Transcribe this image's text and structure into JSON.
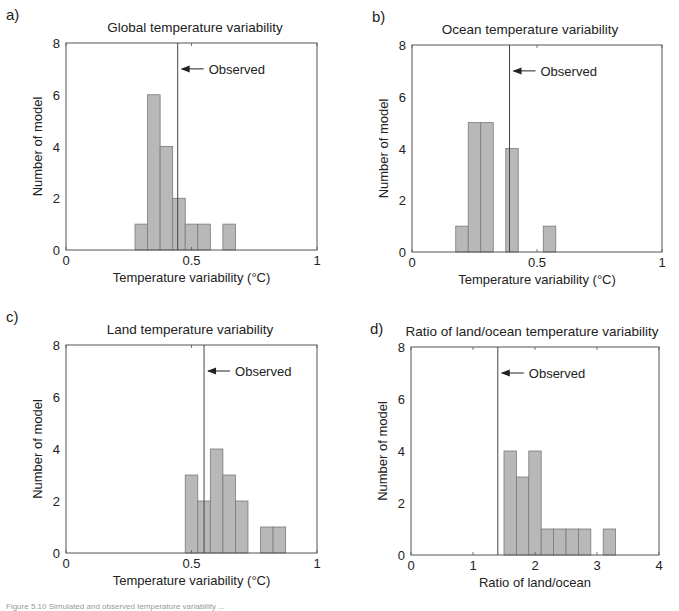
{
  "chart_data": [
    {
      "type": "bar",
      "panel_label": "a)",
      "title": "Global temperature variability",
      "xlabel": "Temperature variability (°C)",
      "ylabel": "Number of model",
      "xlim": [
        0,
        1
      ],
      "ylim": [
        0,
        8
      ],
      "xticks": [
        0,
        0.5,
        1
      ],
      "xtick_labels": [
        "0",
        "0.5",
        "1"
      ],
      "yticks": [
        0,
        2,
        4,
        6,
        8
      ],
      "ytick_labels": [
        "0",
        "2",
        "4",
        "6",
        "8"
      ],
      "bin_width": 0.05,
      "bins": [
        {
          "center": 0.3,
          "count": 1
        },
        {
          "center": 0.35,
          "count": 6
        },
        {
          "center": 0.4,
          "count": 4
        },
        {
          "center": 0.45,
          "count": 2
        },
        {
          "center": 0.5,
          "count": 1
        },
        {
          "center": 0.55,
          "count": 1
        },
        {
          "center": 0.65,
          "count": 1
        }
      ],
      "observed": {
        "value": 0.445,
        "label": "Observed",
        "arrow_y": 7
      }
    },
    {
      "type": "bar",
      "panel_label": "b)",
      "title": "Ocean temperature variability",
      "xlabel": "Temperature variability (°C)",
      "ylabel": "Number of model",
      "xlim": [
        0,
        1
      ],
      "ylim": [
        0,
        8
      ],
      "xticks": [
        0,
        0.5,
        1
      ],
      "xtick_labels": [
        "0",
        "0.5",
        "1"
      ],
      "yticks": [
        0,
        2,
        4,
        6,
        8
      ],
      "ytick_labels": [
        "0",
        "2",
        "4",
        "6",
        "8"
      ],
      "bin_width": 0.05,
      "bins": [
        {
          "center": 0.2,
          "count": 1
        },
        {
          "center": 0.25,
          "count": 5
        },
        {
          "center": 0.3,
          "count": 5
        },
        {
          "center": 0.4,
          "count": 4
        },
        {
          "center": 0.55,
          "count": 1
        }
      ],
      "observed": {
        "value": 0.39,
        "label": "Observed",
        "arrow_y": 7
      }
    },
    {
      "type": "bar",
      "panel_label": "c)",
      "title": "Land temperature variability",
      "xlabel": "Temperature variability (°C)",
      "ylabel": "Number of model",
      "xlim": [
        0,
        1
      ],
      "ylim": [
        0,
        8
      ],
      "xticks": [
        0,
        0.5,
        1
      ],
      "xtick_labels": [
        "0",
        "0.5",
        "1"
      ],
      "yticks": [
        0,
        2,
        4,
        6,
        8
      ],
      "ytick_labels": [
        "0",
        "2",
        "4",
        "6",
        "8"
      ],
      "bin_width": 0.05,
      "bins": [
        {
          "center": 0.5,
          "count": 3
        },
        {
          "center": 0.55,
          "count": 2
        },
        {
          "center": 0.6,
          "count": 4
        },
        {
          "center": 0.65,
          "count": 3
        },
        {
          "center": 0.7,
          "count": 2
        },
        {
          "center": 0.8,
          "count": 1
        },
        {
          "center": 0.85,
          "count": 1
        }
      ],
      "observed": {
        "value": 0.55,
        "label": "Observed",
        "arrow_y": 7
      }
    },
    {
      "type": "bar",
      "panel_label": "d)",
      "title": "Ratio of land/ocean temperature variability",
      "xlabel": "Ratio of land/ocean",
      "ylabel": "Number of model",
      "xlim": [
        0,
        4
      ],
      "ylim": [
        0,
        8
      ],
      "xticks": [
        0,
        1,
        2,
        3,
        4
      ],
      "xtick_labels": [
        "0",
        "1",
        "2",
        "3",
        "4"
      ],
      "yticks": [
        0,
        2,
        4,
        6,
        8
      ],
      "ytick_labels": [
        "0",
        "2",
        "4",
        "6",
        "8"
      ],
      "bin_width": 0.2,
      "bins": [
        {
          "center": 1.6,
          "count": 4
        },
        {
          "center": 1.8,
          "count": 3
        },
        {
          "center": 2.0,
          "count": 4
        },
        {
          "center": 2.2,
          "count": 1
        },
        {
          "center": 2.4,
          "count": 1
        },
        {
          "center": 2.6,
          "count": 1
        },
        {
          "center": 2.8,
          "count": 1
        },
        {
          "center": 3.2,
          "count": 1
        }
      ],
      "observed": {
        "value": 1.4,
        "label": "Observed",
        "arrow_y": 7
      }
    }
  ],
  "colors": {
    "bar_fill": "#b8b8b8",
    "bar_edge": "#7a7a7a",
    "axis": "#555555",
    "text": "#222222"
  },
  "caption": "Figure 5.10  Simulated and observed temperature variability ..."
}
